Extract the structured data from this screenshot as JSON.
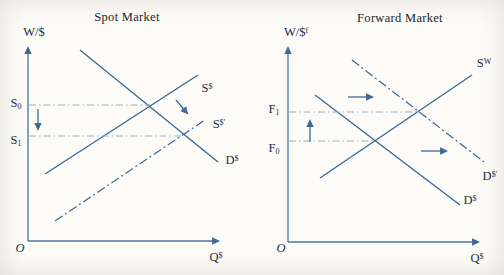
{
  "figure": {
    "colors": {
      "line": "#3f6a93",
      "axis": "#4a769d",
      "guide": "#9cb0c2",
      "label_text": "#1e2b47",
      "title_text": "#23242a",
      "background": "#fcfbf7"
    },
    "panels": [
      {
        "id": "spot",
        "title": "Spot Market",
        "lines": [
          {
            "name": "y-axis",
            "from": [
              28,
              241
            ],
            "to": [
              28,
              48
            ],
            "style": "axis",
            "arrow": true
          },
          {
            "name": "x-axis",
            "from": [
              28,
              241
            ],
            "to": [
              218,
              241
            ],
            "style": "axis",
            "arrow": true
          },
          {
            "name": "demand-line",
            "from": [
              80,
              50
            ],
            "to": [
              218,
              162
            ],
            "style": "solid"
          },
          {
            "name": "supply-line",
            "from": [
              45,
              174
            ],
            "to": [
              198,
              75
            ],
            "style": "solid"
          },
          {
            "name": "supply-shifted-line",
            "from": [
              55,
              221
            ],
            "to": [
              205,
              120
            ],
            "style": "dashdot"
          },
          {
            "name": "s0-guide-line",
            "from": [
              29,
              105
            ],
            "to": [
              150,
              105
            ],
            "style": "guide"
          },
          {
            "name": "s1-guide-line",
            "from": [
              29,
              136
            ],
            "to": [
              183,
              136
            ],
            "style": "guide"
          }
        ],
        "arrows": [
          {
            "name": "price-decrease-arrow",
            "from": [
              38,
              109
            ],
            "to": [
              38,
              129
            ]
          },
          {
            "name": "supply-shift-arrow",
            "from": [
              176,
              100
            ],
            "to": [
              187,
              113
            ]
          }
        ],
        "labels": {
          "y-axis-label": {
            "x": 34,
            "y": 32,
            "base": "W/$"
          },
          "x-axis-label": {
            "x": 216,
            "y": 257,
            "base": "Q",
            "sup": "$"
          },
          "origin-label": {
            "x": 20,
            "y": 248,
            "base": "O",
            "italic": true
          },
          "s0-label": {
            "x": 16,
            "y": 104,
            "base": "S",
            "sub": "0"
          },
          "s1-label": {
            "x": 16,
            "y": 141,
            "base": "S",
            "sub": "1"
          },
          "supply-label": {
            "x": 207,
            "y": 88,
            "base": "S",
            "sup": "$"
          },
          "supply-shifted-label": {
            "x": 219,
            "y": 124,
            "base": "S",
            "sup": "$′"
          },
          "demand-label": {
            "x": 232,
            "y": 160,
            "base": "D",
            "sup": "$"
          }
        }
      },
      {
        "id": "forward",
        "title": "Forward Market",
        "lines": [
          {
            "name": "y-axis",
            "from": [
              288,
              242
            ],
            "to": [
              288,
              48
            ],
            "style": "axis",
            "arrow": true
          },
          {
            "name": "x-axis",
            "from": [
              288,
              242
            ],
            "to": [
              478,
              242
            ],
            "style": "axis",
            "arrow": true
          },
          {
            "name": "demand-line",
            "from": [
              315,
              95
            ],
            "to": [
              460,
              205
            ],
            "style": "solid"
          },
          {
            "name": "demand-shifted-line",
            "from": [
              352,
              60
            ],
            "to": [
              484,
              162
            ],
            "style": "dashdot"
          },
          {
            "name": "supply-line",
            "from": [
              320,
              178
            ],
            "to": [
              472,
              75
            ],
            "style": "solid"
          },
          {
            "name": "f1-guide-line",
            "from": [
              289,
              112
            ],
            "to": [
              419,
              112
            ],
            "style": "guide"
          },
          {
            "name": "f0-guide-line",
            "from": [
              289,
              141
            ],
            "to": [
              376,
              141
            ],
            "style": "guide"
          }
        ],
        "arrows": [
          {
            "name": "price-increase-arrow",
            "from": [
              310,
              142
            ],
            "to": [
              310,
              121
            ]
          },
          {
            "name": "demand-shift-upper-arrow",
            "from": [
              348,
              97
            ],
            "to": [
              372,
              97
            ]
          },
          {
            "name": "demand-shift-lower-arrow",
            "from": [
              421,
              151
            ],
            "to": [
              446,
              151
            ]
          }
        ],
        "labels": {
          "y-axis-label": {
            "x": 296,
            "y": 32,
            "base": "W/$",
            "sup": "f"
          },
          "x-axis-label": {
            "x": 477,
            "y": 258,
            "base": "Q",
            "sup": "$"
          },
          "origin-label": {
            "x": 281,
            "y": 248,
            "base": "O",
            "italic": true
          },
          "f1-label": {
            "x": 274,
            "y": 110,
            "base": "F",
            "sub": "1"
          },
          "f0-label": {
            "x": 274,
            "y": 149,
            "base": "F",
            "sub": "0"
          },
          "supply-label": {
            "x": 484,
            "y": 63,
            "base": "S",
            "sup": "W"
          },
          "demand-label": {
            "x": 470,
            "y": 200,
            "base": "D",
            "sup": "$"
          },
          "demand-shifted-label": {
            "x": 490,
            "y": 176,
            "base": "D",
            "sup": "$′"
          }
        }
      }
    ]
  }
}
